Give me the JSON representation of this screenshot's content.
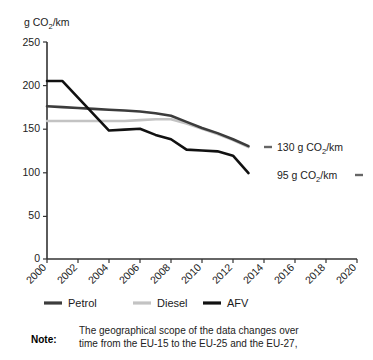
{
  "chart_data": {
    "type": "line",
    "title": "",
    "ylabel": "g CO2/km",
    "ylabel_parts": {
      "pre": "g CO",
      "sub": "2",
      "post": "/km"
    },
    "xlabel": "",
    "xlim": [
      2000,
      2020
    ],
    "ylim": [
      0,
      250
    ],
    "yticks": [
      0,
      50,
      100,
      150,
      200,
      250
    ],
    "ytick_labels": [
      "0",
      "50",
      "100",
      "150",
      "200",
      "250"
    ],
    "xticks": [
      2000,
      2002,
      2004,
      2006,
      2008,
      2010,
      2012,
      2014,
      2016,
      2018,
      2020
    ],
    "xtick_labels": [
      "2000",
      "2002",
      "2004",
      "2006",
      "2008",
      "2010",
      "2012",
      "2014",
      "2016",
      "2018",
      "2020"
    ],
    "grid": false,
    "legend_position": "below-axis",
    "x": [
      2000,
      2001,
      2002,
      2003,
      2004,
      2005,
      2006,
      2007,
      2008,
      2009,
      2010,
      2011,
      2012,
      2013
    ],
    "series": [
      {
        "name": "Petrol",
        "color": "#3c3c3c",
        "values": [
          176,
          175,
          174,
          173,
          172,
          171,
          170,
          168,
          165,
          158,
          151,
          145,
          138,
          130
        ]
      },
      {
        "name": "Diesel",
        "color": "#c3c3c3",
        "values": [
          159,
          159,
          159,
          159,
          159,
          159,
          160,
          161,
          161,
          156,
          150,
          144,
          137,
          129
        ]
      },
      {
        "name": "AFV",
        "color": "#111111",
        "values": [
          205,
          205,
          186,
          167,
          148,
          149,
          150,
          143,
          138,
          126,
          125,
          124,
          119,
          99
        ]
      }
    ],
    "annotations": [
      {
        "id": "target-130",
        "text": "130 g CO2/km",
        "pre": "130 g CO",
        "sub": "2",
        "post": "/km",
        "dash": "left",
        "value": 130
      },
      {
        "id": "target-95",
        "text": "95 g CO2/km",
        "pre": "95 g CO",
        "sub": "2",
        "post": "/km",
        "dash": "right",
        "value": 95
      }
    ]
  },
  "legend": {
    "items": [
      {
        "label": "Petrol",
        "color": "#3c3c3c"
      },
      {
        "label": "Diesel",
        "color": "#c3c3c3"
      },
      {
        "label": "AFV",
        "color": "#111111"
      }
    ]
  },
  "note": {
    "label": "Note:",
    "line1": "The geographical scope of the data changes over",
    "line2": "time from the EU-15 to the EU-25 and the EU-27,"
  }
}
